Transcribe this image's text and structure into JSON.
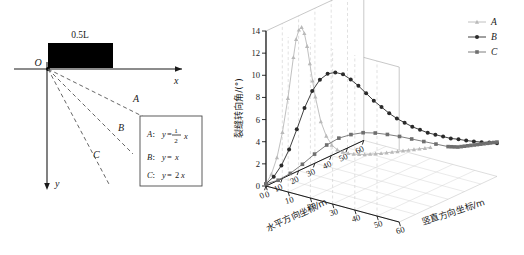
{
  "figure": {
    "left_panel": {
      "name": "crack-path-schematic",
      "origin_label": "O",
      "axis_x_label": "x",
      "axis_y_label": "y",
      "block_label": "0.5L",
      "ray_labels": [
        "A",
        "B",
        "C"
      ],
      "equation_box": {
        "rows": [
          {
            "key": "A",
            "sep": "：",
            "lhs": "y",
            "eq": "=",
            "frac_num": "1",
            "frac_den": "2",
            "var": "x"
          },
          {
            "key": "B",
            "sep": "：",
            "lhs": "y",
            "eq": "=",
            "var": "x"
          },
          {
            "key": "C",
            "sep": "：",
            "lhs": "y",
            "eq": "=",
            "coef": "2",
            "var": "x"
          }
        ]
      }
    },
    "right_panel": {
      "name": "crack-deflection-3d-plot",
      "zlabel": "裂缝转向角/(°)",
      "xlabel": "水平方向坐标/m",
      "ylabel": "竖直方向坐标/m",
      "z_ticks": [
        "0",
        "2",
        "4",
        "6",
        "8",
        "10",
        "12",
        "14"
      ],
      "x_ticks": [
        "0",
        "10",
        "20",
        "30",
        "40",
        "50",
        "60"
      ],
      "y_ticks": [
        "0",
        "10",
        "20",
        "30",
        "40",
        "50",
        "60"
      ],
      "legend": [
        {
          "label": "A",
          "marker": "triangle",
          "color": "#b9b9b9"
        },
        {
          "label": "B",
          "marker": "circle",
          "color": "#2a2a2a"
        },
        {
          "label": "C",
          "marker": "square",
          "color": "#6f6f6f"
        }
      ]
    }
  },
  "chart_data": {
    "type": "line",
    "title": "",
    "xlabel": "水平方向坐标/m",
    "ylabel": "竖直方向坐标/m",
    "zlabel": "裂缝转向角/(°)",
    "xlim": [
      0,
      60
    ],
    "ylim": [
      0,
      60
    ],
    "zlim": [
      0,
      14
    ],
    "grid": true,
    "legend_position": "right",
    "projection": "3d",
    "note": "Each series is a crack path: x = horizontal coordinate (m), y = vertical coordinate (m) following y = k*x, z = crack deflection angle (deg).",
    "series": [
      {
        "name": "A",
        "slope": 0.5,
        "color": "#b9b9b9",
        "marker": "triangle",
        "x": [
          0,
          2,
          4,
          6,
          8,
          10,
          11,
          12,
          13,
          14,
          15,
          16,
          17,
          18,
          20,
          22,
          24,
          26,
          28,
          30,
          32,
          34,
          36,
          38,
          40,
          42,
          44,
          46,
          48,
          50,
          52,
          54,
          56,
          58,
          60
        ],
        "y": [
          0,
          1,
          2,
          3,
          4,
          5,
          5.5,
          6,
          6.5,
          7,
          7.5,
          8,
          8.5,
          9,
          10,
          11,
          12,
          13,
          14,
          15,
          16,
          17,
          18,
          19,
          20,
          21,
          22,
          23,
          24,
          25,
          26,
          27,
          28,
          29,
          30
        ],
        "z": [
          0.2,
          1.0,
          2.4,
          4.6,
          7.6,
          11.2,
          12.8,
          13.6,
          13.8,
          13.2,
          12.0,
          10.4,
          8.8,
          7.3,
          5.0,
          3.6,
          2.7,
          2.2,
          1.9,
          1.7,
          1.55,
          1.45,
          1.35,
          1.3,
          1.25,
          1.2,
          1.18,
          1.15,
          1.12,
          1.1,
          1.08,
          1.05,
          1.03,
          1.0,
          1.0
        ]
      },
      {
        "name": "B",
        "slope": 1,
        "color": "#2a2a2a",
        "marker": "circle",
        "x": [
          0,
          2,
          4,
          6,
          8,
          10,
          12,
          14,
          16,
          18,
          20,
          22,
          24,
          26,
          28,
          30,
          32,
          34,
          36,
          38,
          40,
          42,
          44,
          46,
          48,
          50,
          52,
          54,
          56,
          58,
          60
        ],
        "y": [
          0,
          2,
          4,
          6,
          8,
          10,
          12,
          14,
          16,
          18,
          20,
          22,
          24,
          26,
          28,
          30,
          32,
          34,
          36,
          38,
          40,
          42,
          44,
          46,
          48,
          50,
          52,
          54,
          56,
          58,
          60
        ],
        "z": [
          0.2,
          0.8,
          1.8,
          3.2,
          5.0,
          6.9,
          8.4,
          9.4,
          9.9,
          10.0,
          9.8,
          9.3,
          8.7,
          8.0,
          7.3,
          6.7,
          6.1,
          5.6,
          5.2,
          4.8,
          4.5,
          4.2,
          4.0,
          3.8,
          3.6,
          3.5,
          3.35,
          3.25,
          3.15,
          3.08,
          3.0
        ]
      },
      {
        "name": "C",
        "slope": 2,
        "color": "#6f6f6f",
        "marker": "square",
        "x": [
          0,
          2,
          4,
          6,
          8,
          10,
          12,
          14,
          16,
          18,
          20,
          22,
          24,
          26,
          28,
          30,
          32,
          34,
          36,
          38,
          40,
          42,
          44,
          46,
          48,
          50,
          52,
          54,
          56,
          58,
          60
        ],
        "y": [
          0,
          4,
          8,
          12,
          16,
          20,
          24,
          28,
          32,
          36,
          40,
          44,
          48,
          52,
          56,
          60,
          60,
          60,
          60,
          60,
          60,
          60,
          60,
          60,
          60,
          60,
          60,
          60,
          60,
          60,
          60
        ],
        "z": [
          0.2,
          0.6,
          1.3,
          2.2,
          3.2,
          4.1,
          4.8,
          5.2,
          5.45,
          5.5,
          5.45,
          5.35,
          5.2,
          5.05,
          4.9,
          4.75,
          4.6,
          4.45,
          4.3,
          4.2,
          4.1,
          4.0,
          3.9,
          3.8,
          3.7,
          3.6,
          3.5,
          3.4,
          3.3,
          3.2,
          3.1
        ]
      }
    ]
  }
}
